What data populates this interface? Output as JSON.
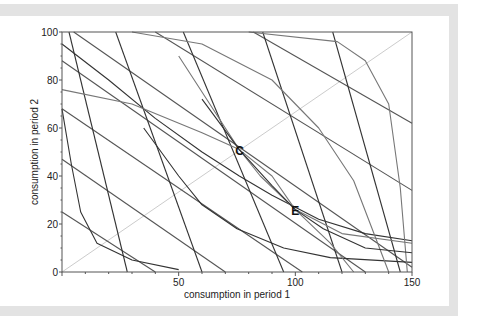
{
  "chart_data": {
    "type": "line",
    "title": "",
    "xlabel": "consumption in period 1",
    "ylabel": "consumption in period 2",
    "xlim": [
      0,
      150
    ],
    "ylim": [
      0,
      100
    ],
    "xticks": [
      50,
      100,
      150
    ],
    "yticks": [
      0,
      20,
      40,
      60,
      80,
      100
    ],
    "xtick_labels": [
      "50",
      "100",
      "150"
    ],
    "ytick_labels": [
      "0",
      "20",
      "40",
      "60",
      "80",
      "100"
    ],
    "grid": false,
    "annotations": [
      {
        "label": "C",
        "x": 76,
        "y": 51
      },
      {
        "label": "E",
        "x": 100,
        "y": 26
      }
    ],
    "series": [
      {
        "name": "45-degree line",
        "color": "#cccccc",
        "points": [
          [
            0,
            0
          ],
          [
            150,
            100
          ]
        ]
      },
      {
        "name": "budget line 1",
        "color": "#555555",
        "points": [
          [
            0,
            25
          ],
          [
            40,
            0
          ]
        ]
      },
      {
        "name": "budget line 2",
        "color": "#555555",
        "points": [
          [
            0,
            47
          ],
          [
            70,
            0
          ]
        ]
      },
      {
        "name": "budget line 3",
        "color": "#555555",
        "points": [
          [
            0,
            68
          ],
          [
            103,
            0
          ]
        ]
      },
      {
        "name": "budget line 4",
        "color": "#555555",
        "points": [
          [
            0,
            88
          ],
          [
            130,
            0
          ]
        ]
      },
      {
        "name": "budget line 5",
        "color": "#555555",
        "points": [
          [
            5,
            100
          ],
          [
            150,
            2
          ]
        ]
      },
      {
        "name": "budget line 6",
        "color": "#555555",
        "points": [
          [
            40,
            100
          ],
          [
            150,
            34
          ]
        ]
      },
      {
        "name": "budget line 7",
        "color": "#555555",
        "points": [
          [
            82,
            100
          ],
          [
            150,
            62
          ]
        ]
      },
      {
        "name": "steep line 1",
        "color": "#333333",
        "points": [
          [
            3,
            100
          ],
          [
            28,
            0
          ]
        ]
      },
      {
        "name": "steep line 2",
        "color": "#333333",
        "points": [
          [
            23,
            100
          ],
          [
            60,
            0
          ]
        ]
      },
      {
        "name": "steep line 3",
        "color": "#333333",
        "points": [
          [
            52,
            100
          ],
          [
            95,
            0
          ]
        ]
      },
      {
        "name": "steep line 4",
        "color": "#333333",
        "points": [
          [
            86,
            100
          ],
          [
            120,
            0
          ]
        ]
      },
      {
        "name": "steep line 5",
        "color": "#333333",
        "points": [
          [
            116,
            100
          ],
          [
            145,
            0
          ]
        ]
      },
      {
        "name": "indifference curve 1",
        "color": "#333333",
        "points": [
          [
            0,
            68
          ],
          [
            4,
            45
          ],
          [
            8,
            25
          ],
          [
            15,
            12
          ],
          [
            30,
            5
          ],
          [
            50,
            1
          ]
        ]
      },
      {
        "name": "indifference curve 2",
        "color": "#333333",
        "points": [
          [
            0,
            95
          ],
          [
            20,
            80
          ],
          [
            40,
            64
          ],
          [
            60,
            50
          ],
          [
            76,
            40
          ],
          [
            90,
            32
          ],
          [
            110,
            22
          ],
          [
            130,
            16
          ],
          [
            150,
            13
          ]
        ]
      },
      {
        "name": "indifference curve 3",
        "color": "#333333",
        "points": [
          [
            35,
            60
          ],
          [
            50,
            40
          ],
          [
            60,
            28
          ],
          [
            75,
            18
          ],
          [
            95,
            10
          ],
          [
            115,
            6
          ],
          [
            150,
            4
          ]
        ]
      },
      {
        "name": "indifference curve 4",
        "color": "#777777",
        "points": [
          [
            0,
            76
          ],
          [
            30,
            70
          ],
          [
            60,
            58
          ],
          [
            76,
            51
          ],
          [
            90,
            40
          ],
          [
            100,
            26
          ],
          [
            115,
            12
          ],
          [
            125,
            0
          ]
        ]
      },
      {
        "name": "indifference curve 5",
        "color": "#777777",
        "points": [
          [
            30,
            100
          ],
          [
            60,
            95
          ],
          [
            90,
            80
          ],
          [
            110,
            60
          ],
          [
            125,
            38
          ],
          [
            140,
            0
          ]
        ]
      },
      {
        "name": "indifference curve 6",
        "color": "#777777",
        "points": [
          [
            80,
            100
          ],
          [
            118,
            96
          ],
          [
            130,
            88
          ],
          [
            140,
            70
          ],
          [
            145,
            35
          ],
          [
            148,
            0
          ]
        ]
      },
      {
        "name": "indifference curve 7",
        "color": "#777777",
        "points": [
          [
            50,
            90
          ],
          [
            70,
            60
          ],
          [
            76,
            51
          ],
          [
            85,
            40
          ],
          [
            100,
            26
          ],
          [
            120,
            16
          ],
          [
            150,
            12
          ]
        ]
      },
      {
        "name": "indifference curve 8",
        "color": "#333333",
        "points": [
          [
            60,
            72
          ],
          [
            76,
            51
          ],
          [
            90,
            36
          ],
          [
            100,
            26
          ],
          [
            112,
            18
          ],
          [
            130,
            10
          ],
          [
            150,
            8
          ]
        ]
      }
    ]
  }
}
